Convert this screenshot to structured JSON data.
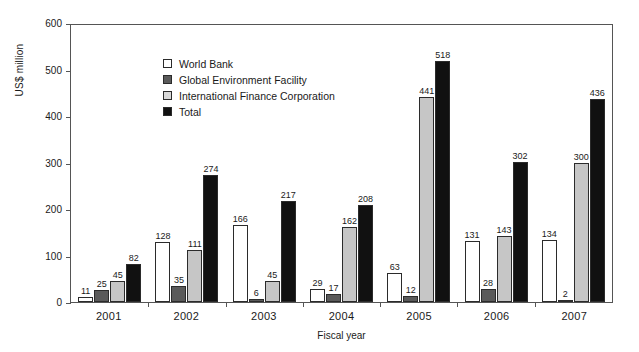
{
  "chart_data": {
    "type": "bar",
    "title": "",
    "xlabel": "Fiscal year",
    "ylabel": "US$ million",
    "ylim": [
      0,
      600
    ],
    "ytick_step": 100,
    "yticks": [
      0,
      100,
      200,
      300,
      400,
      500,
      600
    ],
    "grid": false,
    "legend_position": "top-left",
    "categories": [
      "2001",
      "2002",
      "2003",
      "2004",
      "2005",
      "2006",
      "2007"
    ],
    "series": [
      {
        "name": "World Bank",
        "color": "#ffffff",
        "values": [
          11,
          128,
          166,
          29,
          63,
          131,
          134
        ]
      },
      {
        "name": "Global Environment Facility",
        "color": "#5a5a5a",
        "values": [
          25,
          35,
          6,
          17,
          12,
          28,
          2
        ]
      },
      {
        "name": "International Finance Corporation",
        "color": "#c6c6c6",
        "values": [
          45,
          111,
          45,
          162,
          441,
          143,
          300
        ]
      },
      {
        "name": "Total",
        "color": "#111111",
        "values": [
          82,
          274,
          217,
          208,
          518,
          302,
          436
        ]
      }
    ]
  }
}
